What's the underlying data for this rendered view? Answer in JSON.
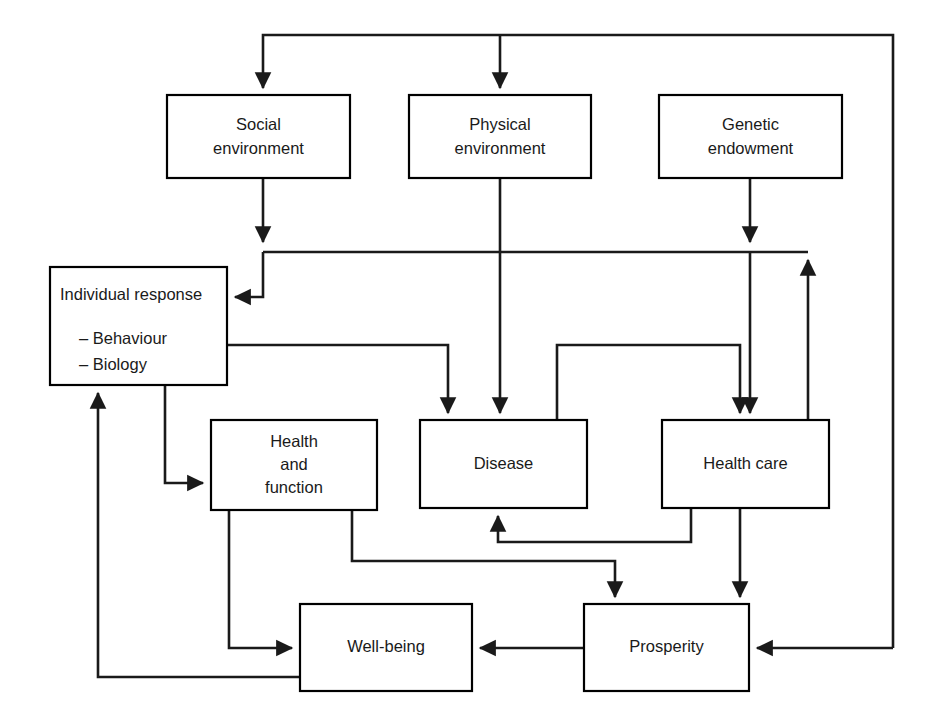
{
  "diagram": {
    "background_color": "#ffffff",
    "line_color": "#1a1a1a",
    "box_fill": "#ffffff",
    "box_stroke": "#000000",
    "nodes": [
      {
        "id": "social-environment",
        "lines": [
          "Social",
          "environment"
        ],
        "x": 167,
        "y": 95,
        "w": 183,
        "h": 83
      },
      {
        "id": "physical-environment",
        "lines": [
          "Physical",
          "environment"
        ],
        "x": 409,
        "y": 95,
        "w": 182,
        "h": 83
      },
      {
        "id": "genetic-endowment",
        "lines": [
          "Genetic",
          "endowment"
        ],
        "x": 659,
        "y": 95,
        "w": 183,
        "h": 83
      },
      {
        "id": "individual-response",
        "lines": [
          "Individual response"
        ],
        "bullets": [
          "– Behaviour",
          "– Biology"
        ],
        "x": 50,
        "y": 267,
        "w": 177,
        "h": 118
      },
      {
        "id": "health-and-function",
        "lines": [
          "Health",
          "and",
          "function"
        ],
        "x": 211,
        "y": 420,
        "w": 166,
        "h": 90
      },
      {
        "id": "disease",
        "lines": [
          "Disease"
        ],
        "x": 420,
        "y": 420,
        "w": 167,
        "h": 88
      },
      {
        "id": "health-care",
        "lines": [
          "Health care"
        ],
        "x": 662,
        "y": 420,
        "w": 167,
        "h": 88
      },
      {
        "id": "well-being",
        "lines": [
          "Well-being"
        ],
        "x": 300,
        "y": 604,
        "w": 172,
        "h": 87
      },
      {
        "id": "prosperity",
        "lines": [
          "Prosperity"
        ],
        "x": 584,
        "y": 604,
        "w": 165,
        "h": 87
      }
    ],
    "edges": [
      {
        "id": "top-bus-to-social",
        "from": "top-bus",
        "to": "social-environment",
        "arrow": true
      },
      {
        "id": "top-bus-to-physical",
        "from": "top-bus",
        "to": "physical-environment",
        "arrow": true
      },
      {
        "id": "prosperity-to-top-bus",
        "from": "prosperity",
        "to": "top-bus",
        "arrow": false
      },
      {
        "id": "social-to-individual-response",
        "from": "social-environment",
        "to": "individual-response",
        "arrow": true
      },
      {
        "id": "physical-to-disease",
        "from": "physical-environment",
        "to": "disease",
        "arrow": true
      },
      {
        "id": "genetic-to-health-care",
        "from": "genetic-endowment",
        "to": "health-care",
        "arrow": true
      },
      {
        "id": "health-care-to-mid-bus",
        "from": "health-care",
        "to": "mid-bus",
        "arrow": true
      },
      {
        "id": "individual-response-to-disease",
        "from": "individual-response",
        "to": "disease",
        "arrow": true
      },
      {
        "id": "disease-to-health-care",
        "from": "disease",
        "to": "health-care",
        "arrow": true
      },
      {
        "id": "individual-response-to-health-and-function",
        "from": "individual-response",
        "to": "health-and-function",
        "arrow": true
      },
      {
        "id": "health-and-function-to-well-being",
        "from": "health-and-function",
        "to": "well-being",
        "arrow": true
      },
      {
        "id": "health-and-function-to-prosperity",
        "from": "health-and-function",
        "to": "prosperity",
        "arrow": true
      },
      {
        "id": "health-care-to-disease",
        "from": "health-care",
        "to": "disease",
        "arrow": true
      },
      {
        "id": "health-care-to-prosperity",
        "from": "health-care",
        "to": "prosperity",
        "arrow": true
      },
      {
        "id": "prosperity-to-well-being",
        "from": "prosperity",
        "to": "well-being",
        "arrow": true
      },
      {
        "id": "well-being-to-individual-response",
        "from": "well-being",
        "to": "individual-response",
        "arrow": true
      }
    ]
  }
}
